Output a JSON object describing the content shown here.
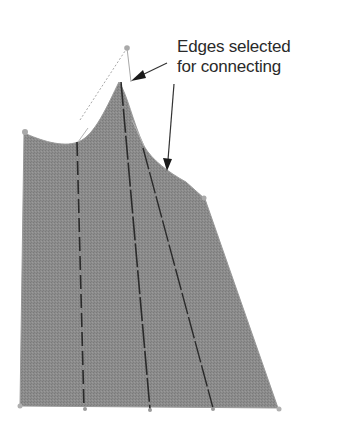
{
  "annotation": {
    "line1": "Edges selected",
    "line2": "for connecting"
  },
  "colors": {
    "fill": "#8a8a8a",
    "fill_dark": "#7c7c7c",
    "edge_light": "#b8b8b8",
    "dash": "#2a2a2a",
    "arrow": "#333333",
    "vertex": "#a9a9a9",
    "background": "#ffffff"
  },
  "shape": {
    "description": "Grey filled panel with curved top edge, control point with dotted handles, and three dashed internal connection lines",
    "vertices": [
      [
        22,
        132
      ],
      [
        20,
        406
      ],
      [
        84,
        408
      ],
      [
        150,
        409
      ],
      [
        213,
        408
      ],
      [
        278,
        408
      ],
      [
        205,
        199
      ],
      [
        127,
        48
      ]
    ],
    "dashed_lines": [
      {
        "from": [
          77,
          142
        ],
        "to": [
          84,
          408
        ]
      },
      {
        "from": [
          121,
          82
        ],
        "to": [
          150,
          409
        ]
      },
      {
        "from": [
          143,
          148
        ],
        "to": [
          213,
          408
        ]
      }
    ]
  }
}
